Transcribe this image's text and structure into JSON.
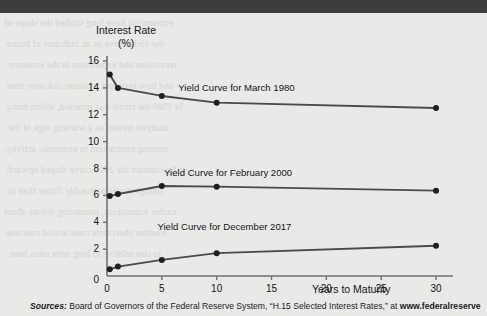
{
  "chart_data": {
    "type": "line",
    "title": "",
    "xlabel": "Years to Maturity",
    "ylabel": "Interest Rate (%)",
    "ylabel_line1": "Interest Rate",
    "ylabel_line2": "(%)",
    "xlim": [
      0,
      31
    ],
    "ylim": [
      0,
      16
    ],
    "xticks": [
      0,
      5,
      10,
      15,
      20,
      25,
      30
    ],
    "yticks": [
      0,
      2,
      4,
      6,
      8,
      10,
      12,
      14,
      16
    ],
    "grid": false,
    "legend_position": "inline-annotation",
    "series": [
      {
        "name": "Yield Curve for March 1980",
        "color": "#4a4a4a",
        "x": [
          0.25,
          1,
          5,
          10,
          30
        ],
        "y": [
          15.0,
          14.0,
          13.4,
          12.9,
          12.5
        ]
      },
      {
        "name": "Yield Curve for February 2000",
        "color": "#4a4a4a",
        "x": [
          0.25,
          1,
          5,
          10,
          30
        ],
        "y": [
          5.95,
          6.1,
          6.7,
          6.65,
          6.35
        ]
      },
      {
        "name": "Yield Curve for December 2017",
        "color": "#4a4a4a",
        "x": [
          0.25,
          1,
          5,
          10,
          30
        ],
        "y": [
          0.5,
          0.7,
          1.2,
          1.7,
          2.25
        ]
      }
    ],
    "annotations": [
      {
        "text": "Yield Curve for March 1980",
        "x": 6.5,
        "y": 13.9
      },
      {
        "text": "Yield Curve for February 2000",
        "x": 5.2,
        "y": 7.6
      },
      {
        "text": "Yield Curve for December 2017",
        "x": 4.6,
        "y": 3.6
      }
    ]
  },
  "sources": {
    "label": "Sources:",
    "body": " Board of Governors of the Federal Reserve System, “H.15 Selected Interest Rates,” at ",
    "url": "www.federalreserve"
  },
  "ghost_text": [
    "economists have long studied the shape of",
    "the yield curve as an indicator of future",
    "recessions and expansions in the economy",
    "and how investors evaluate risk over time.",
    "In 1980 the curve was inverted, which many",
    "analysts treated as a warning sign of the",
    "coming contraction in economic activity.",
    "By contrast the 2017 curve sloped upward,",
    "though it was noticeably flatter than in",
    "earlier expansions, prompting debate about",
    "whether short term rates would continue",
    "to rise relative to long term rates here."
  ]
}
